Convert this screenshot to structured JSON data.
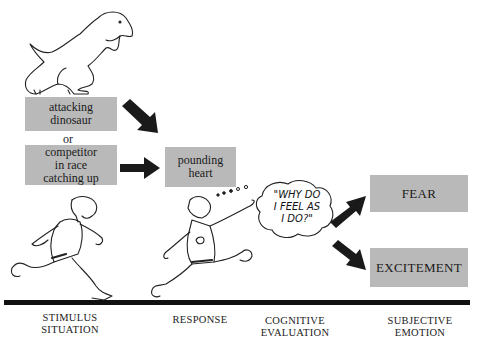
{
  "diagram": {
    "stimulus_boxes": [
      {
        "label": "attacking dinosaur",
        "lines": [
          "attacking",
          "dinosaur"
        ]
      },
      {
        "label": "competitor in race catching up",
        "lines": [
          "competitor",
          "in race",
          "catching up"
        ]
      }
    ],
    "connector_or": "or",
    "response_box": {
      "lines": [
        "pounding",
        "heart"
      ]
    },
    "thought_bubble": {
      "lines": [
        "\"WHY DO",
        "I FEEL AS",
        "I DO?\""
      ]
    },
    "emotion_boxes": [
      {
        "label": "FEAR"
      },
      {
        "label": "EXCITEMENT"
      }
    ],
    "stages": [
      {
        "lines": [
          "STIMULUS",
          "SITUATION"
        ]
      },
      {
        "lines": [
          "RESPONSE"
        ]
      },
      {
        "lines": [
          "COGNITIVE",
          "EVALUATION"
        ]
      },
      {
        "lines": [
          "SUBJECTIVE",
          "EMOTION"
        ]
      }
    ],
    "colors": {
      "box_fill": "#b9b9b9",
      "arrow": "#1a1a1a",
      "line": "#111111"
    }
  }
}
